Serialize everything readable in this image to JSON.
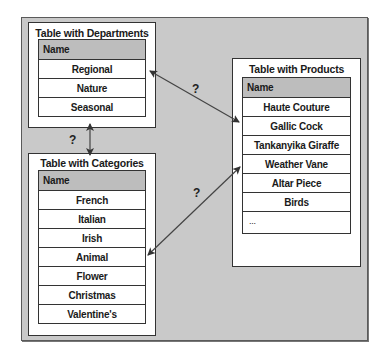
{
  "departments": {
    "title": "Table with Departments",
    "header": "Name",
    "rows": [
      "Regional",
      "Nature",
      "Seasonal"
    ]
  },
  "categories": {
    "title": "Table with Categories",
    "header": "Name",
    "rows": [
      "French",
      "Italian",
      "Irish",
      "Animal",
      "Flower",
      "Christmas",
      "Valentine's"
    ]
  },
  "products": {
    "title": "Table with Products",
    "header": "Name",
    "rows": [
      "Haute Couture",
      "Gallic Cock",
      "Tankanyika Giraffe",
      "Weather Vane",
      "Altar Piece",
      "Birds",
      "..."
    ]
  },
  "relations": {
    "departments_products": "?",
    "departments_categories": "?",
    "categories_products": "?"
  },
  "colors": {
    "frame_bg": "#c9c9c9",
    "header_bg": "#bdbdbd",
    "line": "#333333"
  }
}
